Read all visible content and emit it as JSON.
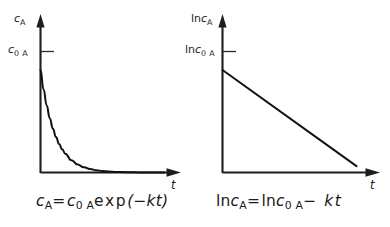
{
  "figure": {
    "background_color": "#ffffff",
    "ink_color": "#1a1a1a",
    "panels": [
      {
        "id": "exponential-decay",
        "y_axis_label_main": "c",
        "y_axis_label_sub": "A",
        "y_tick_label_main": "c",
        "y_tick_label_sub": "0 A",
        "x_axis_label": "t",
        "equation": {
          "lhs_main": "c",
          "lhs_sub": "A",
          "equals": "=",
          "rhs_var_main": "c",
          "rhs_var_sub": "0 A",
          "rhs_func": "exp",
          "rhs_arg": "(−kt)"
        }
      },
      {
        "id": "semilog-linear",
        "y_axis_label_prefix": "ln",
        "y_axis_label_main": "c",
        "y_axis_label_sub": "A",
        "y_tick_label_prefix": "ln",
        "y_tick_label_main": "c",
        "y_tick_label_sub": "0 A",
        "x_axis_label": "t",
        "equation": {
          "lhs_prefix": "ln",
          "lhs_main": "c",
          "lhs_sub": "A",
          "equals": "=",
          "rhs_prefix": "ln",
          "rhs_var_main": "c",
          "rhs_var_sub": "0 A",
          "rhs_tail": "− kt"
        }
      }
    ]
  },
  "chart_data": [
    {
      "type": "line",
      "title": "",
      "subtitle": "",
      "xlabel": "t",
      "ylabel": "c_A",
      "annotations": [
        "c_A = c_0A exp(-kt)"
      ],
      "grid": false,
      "legend": "none",
      "axis_arrows": true,
      "ytick_labels": [
        "c_0 A"
      ],
      "ytick_values": [
        1.0
      ],
      "xtick_labels": [],
      "xlim": [
        0,
        10
      ],
      "ylim": [
        0,
        1.18
      ],
      "series": [
        {
          "name": "c_A(t) = c_0A exp(-k t)",
          "k": 0.85,
          "c0": 1.0,
          "x": [
            0,
            0.25,
            0.5,
            0.75,
            1.0,
            1.25,
            1.5,
            1.75,
            2.0,
            2.5,
            3.0,
            3.5,
            4.0,
            4.5,
            5.0,
            6.0,
            7.0,
            8.0,
            9.0,
            10.0
          ],
          "y": [
            1.0,
            0.809,
            0.654,
            0.529,
            0.427,
            0.346,
            0.279,
            0.226,
            0.183,
            0.119,
            0.078,
            0.051,
            0.033,
            0.022,
            0.014,
            0.006,
            0.003,
            0.001,
            0.0005,
            0.0002
          ]
        }
      ]
    },
    {
      "type": "line",
      "title": "",
      "subtitle": "",
      "xlabel": "t",
      "ylabel": "ln c_A",
      "annotations": [
        "ln c_A = ln c_0A - kt"
      ],
      "grid": false,
      "legend": "none",
      "axis_arrows": true,
      "ytick_labels": [
        "ln c_0 A"
      ],
      "ytick_values": [
        1.0
      ],
      "xtick_labels": [],
      "xlim": [
        0,
        10
      ],
      "ylim": [
        0,
        1.18
      ],
      "series": [
        {
          "name": "ln c_A(t) = ln c_0A - k t",
          "slope": -0.1178,
          "intercept": 1.0,
          "x": [
            0,
            10
          ],
          "y": [
            1.0,
            0.0625
          ]
        }
      ]
    }
  ]
}
